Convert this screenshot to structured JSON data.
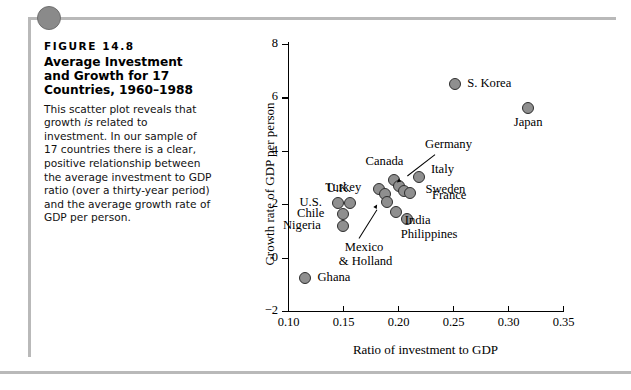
{
  "figure": {
    "number": "FIGURE  14.8",
    "title": "Average Investment and Growth for 17 Countries, 1960–1988",
    "body_part1": "This scatter plot reveals that growth ",
    "body_italic": "is",
    "body_part2": " related to investment. In our sample of 17 countries there is a clear, positive relationship between the average investment to GDP ratio (over a thirty-year period) and the average growth rate of GDP per person."
  },
  "chart_data": {
    "type": "scatter",
    "title": "Average Investment and Growth for 17 Countries, 1960–1988",
    "xlabel": "Ratio of investment to GDP",
    "ylabel": "Growth rate of GDP per person",
    "xlim": [
      0.1,
      0.35
    ],
    "ylim": [
      -2,
      8
    ],
    "xticks": [
      "0.10",
      "0.15",
      "0.20",
      "0.25",
      "0.30",
      "0.35"
    ],
    "xtick_values": [
      0.1,
      0.15,
      0.2,
      0.25,
      0.3,
      0.35
    ],
    "yticks": [
      "−2",
      "0",
      "2",
      "4",
      "6",
      "8"
    ],
    "ytick_values": [
      -2,
      0,
      2,
      4,
      6,
      8
    ],
    "grid": false,
    "legend": "none",
    "marker_color": "#8f8f8f",
    "marker_edge_color": "#2e2e2e",
    "points": [
      {
        "label": "Ghana",
        "x": 0.115,
        "y": -0.75,
        "label_pos": "right"
      },
      {
        "label": "Nigeria",
        "x": 0.15,
        "y": 1.2,
        "label_pos": "left"
      },
      {
        "label": "Chile",
        "x": 0.15,
        "y": 1.62,
        "label_pos": "left"
      },
      {
        "label": "U.S.",
        "x": 0.145,
        "y": 2.05,
        "label_pos": "left"
      },
      {
        "label": "U.K.",
        "x": 0.156,
        "y": 2.05,
        "label_pos": "above"
      },
      {
        "label": "Turkey",
        "x": 0.183,
        "y": 2.58,
        "label_pos": "left"
      },
      {
        "label": "Mexico",
        "x": 0.188,
        "y": 2.38,
        "label_pos": "leader"
      },
      {
        "label": "Holland",
        "x": 0.19,
        "y": 2.1,
        "label_pos": "leader"
      },
      {
        "label": "India",
        "x": 0.198,
        "y": 1.72,
        "label_pos": "right"
      },
      {
        "label": "Canada",
        "x": 0.196,
        "y": 2.9,
        "label_pos": "above"
      },
      {
        "label": "Germany",
        "x": 0.201,
        "y": 2.68,
        "label_pos": "leader"
      },
      {
        "label": "Sweden",
        "x": 0.205,
        "y": 2.48,
        "label_pos": "right"
      },
      {
        "label": "Philippines",
        "x": 0.208,
        "y": 1.45,
        "label_pos": "below"
      },
      {
        "label": "France",
        "x": 0.211,
        "y": 2.42,
        "label_pos": "right"
      },
      {
        "label": "Italy",
        "x": 0.219,
        "y": 3.02,
        "label_pos": "right"
      },
      {
        "label": "S. Korea",
        "x": 0.252,
        "y": 6.5,
        "label_pos": "right"
      },
      {
        "label": "Japan",
        "x": 0.318,
        "y": 5.6,
        "label_pos": "below"
      }
    ],
    "annotations": [
      {
        "text": "Germany",
        "target": "Germany"
      },
      {
        "text": "Mexico & Holland",
        "target": "Mexico/Holland"
      }
    ]
  },
  "labels": {
    "ghana": "Ghana",
    "nigeria": "Nigeria",
    "chile": "Chile",
    "us": "U.S.",
    "uk": "U.K.",
    "turkey": "Turkey",
    "canada": "Canada",
    "germany": "Germany",
    "india": "India",
    "sweden": "Sweden",
    "france": "France",
    "italy": "Italy",
    "philippines": "Philippines",
    "skorea": "S. Korea",
    "japan": "Japan",
    "mexico_holland_1": "Mexico",
    "mexico_holland_2": "& Holland"
  }
}
